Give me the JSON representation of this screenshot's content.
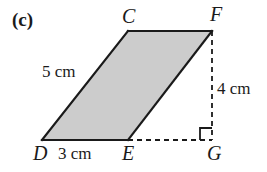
{
  "figure": {
    "part_label": "(c)",
    "shape_name": "parallelogram",
    "fill_color": "#cccccc",
    "stroke_color": "#1a1a1a",
    "background_color": "#ffffff",
    "vertices": [
      {
        "name": "C",
        "label": "C",
        "x": 128,
        "y": 31
      },
      {
        "name": "F",
        "label": "F",
        "x": 212,
        "y": 31
      },
      {
        "name": "E",
        "label": "E",
        "x": 128,
        "y": 140
      },
      {
        "name": "D",
        "label": "D",
        "x": 42,
        "y": 140
      },
      {
        "name": "G",
        "label": "G",
        "x": 212,
        "y": 140
      }
    ],
    "vertex_labels": [
      {
        "key": "C",
        "text": "C",
        "left": 122,
        "top": 6
      },
      {
        "key": "F",
        "text": "F",
        "left": 210,
        "top": 4
      },
      {
        "key": "D",
        "text": "D",
        "left": 33,
        "top": 143
      },
      {
        "key": "E",
        "text": "E",
        "left": 122,
        "top": 143
      },
      {
        "key": "G",
        "text": "G",
        "left": 207,
        "top": 143
      }
    ],
    "measurements": [
      {
        "key": "side-dc",
        "text": "5 cm",
        "left": 42,
        "top": 63,
        "describes": "side D to C"
      },
      {
        "key": "height-fg",
        "text": "4 cm",
        "left": 217,
        "top": 80,
        "describes": "height F to G"
      },
      {
        "key": "base-de",
        "text": "3 cm",
        "left": 58,
        "top": 145,
        "describes": "base D to E"
      }
    ],
    "dashed_segments": [
      {
        "key": "fg",
        "from": "F",
        "to": "G"
      },
      {
        "key": "eg",
        "from": "E",
        "to": "G"
      }
    ],
    "right_angle": {
      "at": "G",
      "size": 12,
      "marked": true
    }
  }
}
